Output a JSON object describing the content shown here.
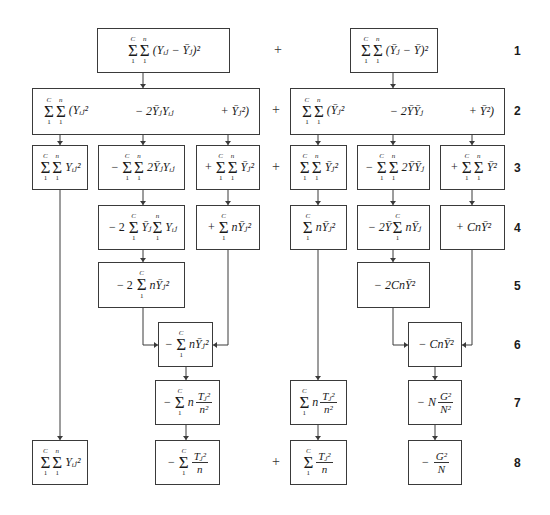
{
  "row_labels": [
    "1",
    "2",
    "3",
    "4",
    "5",
    "6",
    "7",
    "8"
  ],
  "plus_sign": "+",
  "limits": {
    "upper_c": "C",
    "upper_n": "n",
    "lower": "1"
  },
  "boxes": {
    "r1_left": {
      "expr": "(Yᵢⱼ − Ȳⱼ)²"
    },
    "r1_right": {
      "expr": "(Ȳⱼ − Ȳ)²"
    },
    "r2_left": {
      "t1": "(Yᵢⱼ²",
      "t2": "− 2ȲⱼYᵢⱼ",
      "t3": "+ Ȳⱼ²)"
    },
    "r2_right": {
      "t1": "(Ȳⱼ²",
      "t2": "− 2ȲȲⱼ",
      "t3": "+ Ȳ²)"
    },
    "r3_a": {
      "expr": "Yᵢⱼ²"
    },
    "r3_b": {
      "prefix": "−",
      "expr": "2ȲⱼYᵢⱼ"
    },
    "r3_c": {
      "prefix": "+",
      "expr": "Ȳⱼ²"
    },
    "r3_d": {
      "expr": "Ȳⱼ²"
    },
    "r3_e": {
      "prefix": "−",
      "expr": "2ȲȲⱼ"
    },
    "r3_f": {
      "prefix": "+",
      "expr": "Ȳ²"
    },
    "r4_b": {
      "prefix": "− 2",
      "mid": "Ȳⱼ",
      "expr": "Yᵢⱼ"
    },
    "r4_c": {
      "prefix": "+",
      "expr": "nȲⱼ²"
    },
    "r4_d": {
      "expr": "nȲⱼ²"
    },
    "r4_e": {
      "prefix": "− 2Ȳ",
      "expr": "nȲⱼ"
    },
    "r4_f": {
      "expr": "+ CnȲ²"
    },
    "r5_b": {
      "prefix": "− 2",
      "expr": "nȲⱼ²"
    },
    "r5_e": {
      "expr": "− 2CnȲ²"
    },
    "r6_b": {
      "prefix": "−",
      "expr": "nȲⱼ²"
    },
    "r6_e": {
      "expr": "− CnȲ²"
    },
    "r7_b": {
      "prefix": "−",
      "coef": "n",
      "num": "Tⱼ²",
      "den": "n²"
    },
    "r7_d": {
      "coef": "n",
      "num": "Tⱼ²",
      "den": "n²"
    },
    "r7_e": {
      "prefix": "− N",
      "num": "G²",
      "den": "N²"
    },
    "r8_a": {
      "expr": "Yᵢⱼ²"
    },
    "r8_b": {
      "prefix": "−",
      "num": "Tⱼ²",
      "den": "n"
    },
    "r8_d": {
      "num": "Tⱼ²",
      "den": "n"
    },
    "r8_e": {
      "prefix": "−",
      "num": "G²",
      "den": "N"
    }
  }
}
